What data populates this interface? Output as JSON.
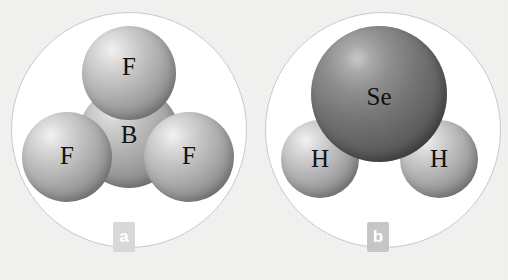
{
  "figure": {
    "background_color": "#f3f3f1",
    "plate_color": "#ffffff",
    "plate_border_color": "#c9c9c9"
  },
  "panels": [
    {
      "id": "a",
      "badge_label": "a",
      "badge_color": "#d8d8d8",
      "molecule": "BF3",
      "geometry": "trigonal planar",
      "atoms": [
        {
          "element": "B",
          "role": "central",
          "shade": "medium-gray",
          "color": "#a3a3a3"
        },
        {
          "element": "F",
          "role": "top",
          "shade": "light-gray",
          "color": "#ababab"
        },
        {
          "element": "F",
          "role": "left",
          "shade": "light-gray",
          "color": "#ababab"
        },
        {
          "element": "F",
          "role": "right",
          "shade": "light-gray",
          "color": "#ababab"
        }
      ]
    },
    {
      "id": "b",
      "badge_label": "b",
      "badge_color": "#c6c6c6",
      "molecule": "H2Se",
      "geometry": "bent",
      "atoms": [
        {
          "element": "Se",
          "role": "central",
          "shade": "dark-gray",
          "color": "#616161"
        },
        {
          "element": "H",
          "role": "left",
          "shade": "light-gray",
          "color": "#ababab"
        },
        {
          "element": "H",
          "role": "right",
          "shade": "light-gray",
          "color": "#ababab"
        }
      ]
    }
  ],
  "labels": {
    "b_center": "B",
    "f_top": "F",
    "f_left": "F",
    "f_right": "F",
    "se": "Se",
    "h_left": "H",
    "h_right": "H",
    "badge_a": "a",
    "badge_b": "b"
  }
}
